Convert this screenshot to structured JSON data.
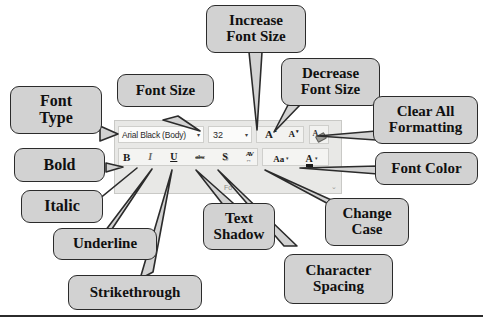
{
  "ribbon": {
    "group_label": "Fo",
    "dialog_launcher": "⌄",
    "font_name": {
      "value": "Arial Black (Body)",
      "caret": "▾"
    },
    "font_size": {
      "value": "32",
      "caret": "▾"
    },
    "increase_font_size": {
      "glyph": "A",
      "sup": "▴"
    },
    "decrease_font_size": {
      "glyph": "A",
      "sup": "▾"
    },
    "clear_formatting": {
      "glyph": "A"
    },
    "bold": "B",
    "italic": "I",
    "underline": "U",
    "strikethrough": "abc",
    "text_shadow": "S",
    "character_spacing": {
      "top": "AV",
      "bottom": "↔"
    },
    "change_case": "Aa",
    "font_color": "A",
    "caret": "▾"
  },
  "callouts": [
    {
      "id": "font-type",
      "lines": [
        "Font",
        "Type"
      ]
    },
    {
      "id": "font-size",
      "lines": [
        "Font Size"
      ]
    },
    {
      "id": "increase-font",
      "lines": [
        "Increase",
        "Font Size"
      ]
    },
    {
      "id": "decrease-font",
      "lines": [
        "Decrease",
        "Font Size"
      ]
    },
    {
      "id": "clear-formatting",
      "lines": [
        "Clear All",
        "Formatting"
      ]
    },
    {
      "id": "font-color",
      "lines": [
        "Font Color"
      ]
    },
    {
      "id": "bold",
      "lines": [
        "Bold"
      ]
    },
    {
      "id": "italic",
      "lines": [
        "Italic"
      ]
    },
    {
      "id": "underline",
      "lines": [
        "Underline"
      ]
    },
    {
      "id": "strikethrough",
      "lines": [
        "Strikethrough"
      ]
    },
    {
      "id": "text-shadow",
      "lines": [
        "Text",
        "Shadow"
      ]
    },
    {
      "id": "change-case",
      "lines": [
        "Change",
        "Case"
      ]
    },
    {
      "id": "character-spacing",
      "lines": [
        "Character",
        "Spacing"
      ]
    }
  ]
}
